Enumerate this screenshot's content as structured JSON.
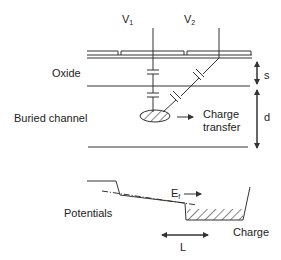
{
  "labels": {
    "v1": "V",
    "v1_sub": "1",
    "v2": "V",
    "v2_sub": "2",
    "oxide": "Oxide",
    "buried_channel": "Buried channel",
    "charge_transfer_line1": "Charge",
    "charge_transfer_line2": "transfer",
    "s": "s",
    "d": "d",
    "potentials": "Potentials",
    "ef": "E",
    "ef_sub": "f",
    "charge": "Charge",
    "l": "L"
  },
  "colors": {
    "stroke": "#333333",
    "background": "#ffffff"
  }
}
